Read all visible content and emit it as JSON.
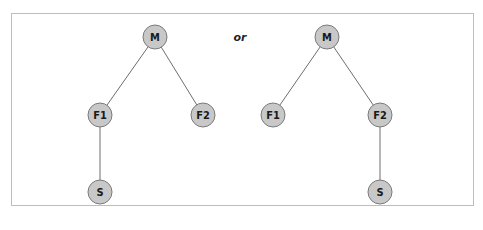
{
  "diagram": {
    "separator_label": "or",
    "colors": {
      "node_fill": "#c8c8c8",
      "node_stroke": "#7a7a7a",
      "edge": "#6e6e6e",
      "frame": "#bdbdbd"
    },
    "trees": [
      {
        "name": "left-tree",
        "nodes": [
          {
            "id": "M",
            "label": "M",
            "x": 155,
            "y": 37
          },
          {
            "id": "F1",
            "label": "F1",
            "x": 100,
            "y": 115
          },
          {
            "id": "F2",
            "label": "F2",
            "x": 203,
            "y": 115
          },
          {
            "id": "S",
            "label": "S",
            "x": 100,
            "y": 192
          }
        ],
        "edges": [
          [
            "M",
            "F1"
          ],
          [
            "M",
            "F2"
          ],
          [
            "F1",
            "S"
          ]
        ]
      },
      {
        "name": "right-tree",
        "nodes": [
          {
            "id": "M",
            "label": "M",
            "x": 327,
            "y": 37
          },
          {
            "id": "F1",
            "label": "F1",
            "x": 273,
            "y": 115
          },
          {
            "id": "F2",
            "label": "F2",
            "x": 380,
            "y": 115
          },
          {
            "id": "S",
            "label": "S",
            "x": 380,
            "y": 192
          }
        ],
        "edges": [
          [
            "M",
            "F1"
          ],
          [
            "M",
            "F2"
          ],
          [
            "F2",
            "S"
          ]
        ]
      }
    ]
  }
}
